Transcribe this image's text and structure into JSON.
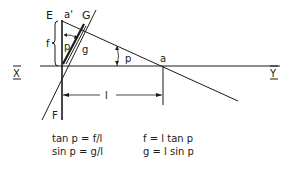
{
  "diagram": {
    "labels": {
      "E": "E",
      "a_prime": "a'",
      "G": "G",
      "f": "f",
      "p_upper": "p",
      "g": "g",
      "p_angle": "p",
      "a": "a",
      "X": "X",
      "Y": "Y",
      "F": "F",
      "l": "l"
    },
    "equations": {
      "left": [
        "tan p = f/l",
        "sin p = g/l"
      ],
      "right": [
        "f = l tan p",
        "g = l sin p"
      ]
    },
    "colors": {
      "ink": "#1a1a1a",
      "background": "#ffffff"
    }
  }
}
